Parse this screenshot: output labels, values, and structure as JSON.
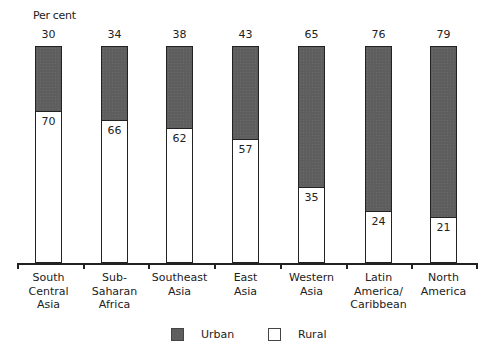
{
  "chart_data": {
    "type": "bar",
    "stacked": true,
    "title": "",
    "ylabel": "Per cent",
    "xlabel": "",
    "ylim": [
      0,
      100
    ],
    "categories": [
      "South Central Asia",
      "Sub-Saharan Africa",
      "Southeast Asia",
      "East Asia",
      "Western Asia",
      "Latin America/ Caribbean",
      "North America"
    ],
    "series": [
      {
        "name": "Urban",
        "color": "#5e5e5e",
        "values": [
          30,
          34,
          38,
          43,
          65,
          76,
          79
        ]
      },
      {
        "name": "Rural",
        "color": "#ffffff",
        "values": [
          70,
          66,
          62,
          57,
          35,
          24,
          21
        ]
      }
    ],
    "legend": [
      "Urban",
      "Rural"
    ],
    "legend_position": "bottom",
    "grid": false
  },
  "labels": {
    "ylabel": "Per cent",
    "categories": [
      [
        "South",
        "Central",
        "Asia"
      ],
      [
        "Sub-",
        "Saharan",
        "Africa"
      ],
      [
        "Southeast",
        "Asia"
      ],
      [
        "East",
        "Asia"
      ],
      [
        "Western",
        "Asia"
      ],
      [
        "Latin",
        "America/",
        "Caribbean"
      ],
      [
        "North",
        "America"
      ]
    ],
    "urban": [
      "30",
      "34",
      "38",
      "43",
      "65",
      "76",
      "79"
    ],
    "rural": [
      "70",
      "66",
      "62",
      "57",
      "35",
      "24",
      "21"
    ],
    "legend_urban": "Urban",
    "legend_rural": "Rural"
  }
}
